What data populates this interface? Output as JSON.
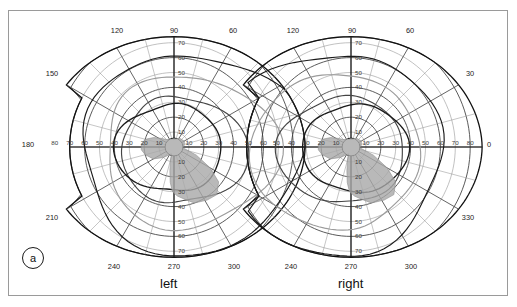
{
  "figure": {
    "panel_label": "a",
    "caption_left": "left",
    "caption_right": "right"
  },
  "chart_data": {
    "type": "scatter",
    "title": "",
    "subtitle": "",
    "xlabel": "",
    "ylabel": "",
    "grid": true,
    "legend": "none",
    "projection": "polar",
    "panels": [
      {
        "name": "left",
        "caption": "left",
        "center_deg": [
          0,
          0
        ],
        "meridian_ticks": [
          0,
          30,
          60,
          90,
          120,
          150,
          180,
          210,
          240,
          270,
          300,
          330
        ],
        "meridian_labels_shown": [
          "120",
          "90",
          "60",
          "150",
          "180",
          "210",
          "240",
          "270",
          "300"
        ],
        "eccentricity_rings": [
          10,
          20,
          30,
          40,
          50,
          60,
          70,
          80
        ],
        "eccentricity_labels_vertical": [
          "10",
          "20",
          "30",
          "40",
          "50",
          "60",
          "70"
        ],
        "eccentricity_labels_horizontal_left": [
          "80",
          "70",
          "60",
          "50",
          "40",
          "30",
          "20",
          "10"
        ],
        "eccentricity_labels_horizontal_right": [
          "10",
          "20",
          "30",
          "40",
          "50",
          "60"
        ],
        "rmax_deg": 90,
        "isopters": [
          {
            "name": "outer-isopter",
            "color": "#1a1a1a",
            "extent_deg": {
              "temporal": 88,
              "nasal": 60,
              "superior": 62,
              "inferior": 72
            }
          },
          {
            "name": "mid-isopter",
            "color": "#2a2a2a",
            "extent_deg": {
              "temporal": 70,
              "nasal": 45,
              "superior": 48,
              "inferior": 55
            }
          },
          {
            "name": "inner-isopter",
            "color": "#444444",
            "extent_deg": {
              "temporal": 50,
              "nasal": 35,
              "superior": 33,
              "inferior": 38
            }
          },
          {
            "name": "defect-border-isopter",
            "color": "#1a1a1a",
            "extent_deg": {
              "temporal": 32,
              "nasal": 40,
              "superior": 28,
              "inferior": 30
            }
          }
        ],
        "scotoma": {
          "label": "shaded-field-defect",
          "fill": "#a8a8a8",
          "quadrant": "infero-nasal",
          "extent_deg": {
            "from": 5,
            "to": 42
          }
        }
      },
      {
        "name": "right",
        "caption": "right",
        "center_deg": [
          0,
          0
        ],
        "meridian_ticks": [
          0,
          30,
          60,
          90,
          120,
          150,
          180,
          210,
          240,
          270,
          300,
          330
        ],
        "meridian_labels_shown": [
          "120",
          "90",
          "60",
          "30",
          "0",
          "330",
          "240",
          "270",
          "300"
        ],
        "eccentricity_rings": [
          10,
          20,
          30,
          40,
          50,
          60,
          70,
          80
        ],
        "eccentricity_labels_vertical": [
          "10",
          "20",
          "30",
          "40",
          "50",
          "60",
          "70"
        ],
        "eccentricity_labels_horizontal_left": [
          "50",
          "40",
          "30",
          "20",
          "10"
        ],
        "eccentricity_labels_horizontal_right": [
          "10",
          "20",
          "30",
          "40",
          "50",
          "60",
          "70",
          "80"
        ],
        "rmax_deg": 90,
        "isopters": [
          {
            "name": "outer-isopter",
            "color": "#1a1a1a",
            "extent_deg": {
              "temporal": 88,
              "nasal": 60,
              "superior": 62,
              "inferior": 72
            }
          },
          {
            "name": "mid-isopter",
            "color": "#2a2a2a",
            "extent_deg": {
              "temporal": 70,
              "nasal": 45,
              "superior": 48,
              "inferior": 55
            }
          },
          {
            "name": "inner-isopter",
            "color": "#444444",
            "extent_deg": {
              "temporal": 50,
              "nasal": 35,
              "superior": 33,
              "inferior": 38
            }
          },
          {
            "name": "defect-border-isopter",
            "color": "#1a1a1a",
            "extent_deg": {
              "temporal": 32,
              "nasal": 40,
              "superior": 28,
              "inferior": 30
            }
          }
        ],
        "scotoma": {
          "label": "shaded-field-defect",
          "fill": "#a8a8a8",
          "quadrant": "infero-temporal",
          "extent_deg": {
            "from": 5,
            "to": 45
          }
        }
      }
    ],
    "colors": {
      "grid_major": "#3c3c3c",
      "grid_minor": "#8d8d8d",
      "isopter_dark": "#1a1a1a",
      "isopter_light": "#9b9b9b",
      "scotoma_fill": "#a8a8a8",
      "frame": "#9a9a9a",
      "text": "#1a1a1a",
      "background": "#ffffff"
    }
  },
  "axes": {
    "left_panel": {
      "top_labels": [
        {
          "value": "120",
          "x": 117,
          "y": 33
        },
        {
          "value": "90",
          "x": 174,
          "y": 33
        },
        {
          "value": "60",
          "x": 233,
          "y": 33
        }
      ],
      "bottom_labels": [
        {
          "value": "240",
          "x": 114,
          "y": 269
        },
        {
          "value": "270",
          "x": 174,
          "y": 269
        },
        {
          "value": "300",
          "x": 234,
          "y": 269
        }
      ],
      "side_labels": [
        {
          "value": "150",
          "x": 52,
          "y": 76
        },
        {
          "value": "180",
          "x": 28,
          "y": 147
        },
        {
          "value": "210",
          "x": 52,
          "y": 220
        }
      ],
      "vertical_ecc_labels": [
        "70",
        "60",
        "50",
        "40",
        "30",
        "20",
        "10",
        "10",
        "20",
        "30",
        "40",
        "50",
        "60",
        "70"
      ],
      "horizontal_ecc_labels": [
        "80",
        "70",
        "60",
        "50",
        "40",
        "30",
        "20",
        "10",
        "10",
        "20",
        "30",
        "40",
        "50",
        "60"
      ]
    },
    "right_panel": {
      "top_labels": [
        {
          "value": "120",
          "x": 293,
          "y": 33
        },
        {
          "value": "90",
          "x": 352,
          "y": 33
        },
        {
          "value": "60",
          "x": 410,
          "y": 33
        }
      ],
      "bottom_labels": [
        {
          "value": "240",
          "x": 291,
          "y": 269
        },
        {
          "value": "270",
          "x": 351,
          "y": 269
        },
        {
          "value": "300",
          "x": 411,
          "y": 269
        }
      ],
      "side_labels": [
        {
          "value": "30",
          "x": 470,
          "y": 76
        },
        {
          "value": "0",
          "x": 489,
          "y": 147
        },
        {
          "value": "330",
          "x": 468,
          "y": 220
        }
      ],
      "vertical_ecc_labels": [
        "70",
        "60",
        "50",
        "40",
        "30",
        "20",
        "10",
        "10",
        "20",
        "30",
        "40",
        "50",
        "60",
        "70"
      ],
      "horizontal_ecc_labels": [
        "50",
        "40",
        "30",
        "20",
        "10",
        "10",
        "20",
        "30",
        "40",
        "50",
        "60",
        "70",
        "80"
      ]
    }
  }
}
